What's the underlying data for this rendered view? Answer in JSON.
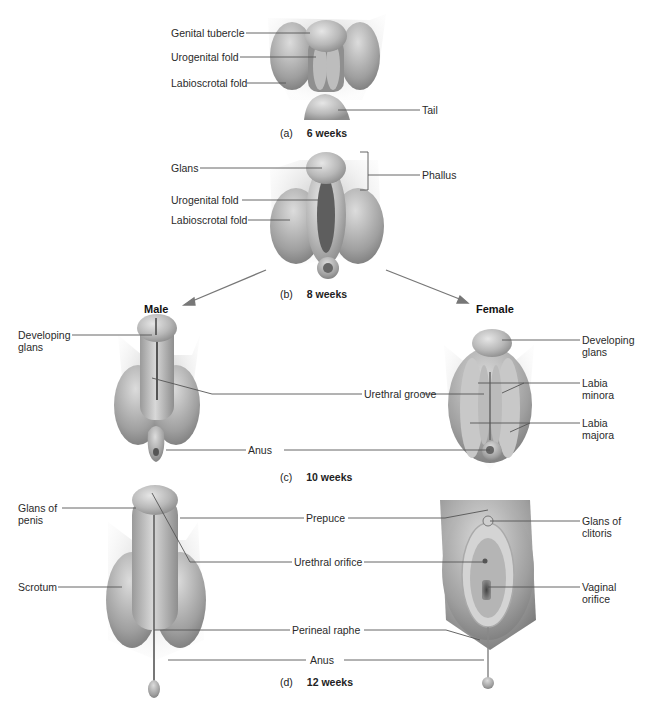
{
  "figure": {
    "panels": [
      {
        "id": "a",
        "tag": "(a)",
        "stage": "6 weeks",
        "labels": [
          "Genital tubercle",
          "Urogenital fold",
          "Labioscrotal fold",
          "Tail"
        ]
      },
      {
        "id": "b",
        "tag": "(b)",
        "stage": "8 weeks",
        "labels": [
          "Glans",
          "Urogenital fold",
          "Labioscrotal fold",
          "Phallus"
        ]
      },
      {
        "id": "c",
        "tag": "(c)",
        "stage": "10 weeks",
        "male_heading": "Male",
        "female_heading": "Female",
        "male_labels": [
          "Developing\nglans"
        ],
        "shared_labels": [
          "Urethral groove",
          "Anus"
        ],
        "female_labels": [
          "Developing\nglans",
          "Labia\nminora",
          "Labia\nmajora"
        ]
      },
      {
        "id": "d",
        "tag": "(d)",
        "stage": "12 weeks",
        "male_labels": [
          "Glans of\npenis",
          "Scrotum"
        ],
        "shared_labels": [
          "Prepuce",
          "Urethral orifice",
          "Perineal raphe",
          "Anus"
        ],
        "female_labels": [
          "Glans of\nclitoris",
          "Vaginal\norifice"
        ]
      }
    ]
  },
  "text": {
    "a_genital_tubercle": "Genital tubercle",
    "a_urogenital_fold": "Urogenital fold",
    "a_labioscrotal_fold": "Labioscrotal fold",
    "a_tail": "Tail",
    "a_tag": "(a)",
    "a_stage": "6 weeks",
    "b_glans": "Glans",
    "b_urogenital_fold": "Urogenital fold",
    "b_labioscrotal_fold": "Labioscrotal fold",
    "b_phallus": "Phallus",
    "b_tag": "(b)",
    "b_stage": "8 weeks",
    "male": "Male",
    "female": "Female",
    "c_male_dev_glans_1": "Developing",
    "c_male_dev_glans_2": "glans",
    "c_urethral_groove": "Urethral groove",
    "c_anus": "Anus",
    "c_fem_dev_glans_1": "Developing",
    "c_fem_dev_glans_2": "glans",
    "c_labia_minora_1": "Labia",
    "c_labia_minora_2": "minora",
    "c_labia_majora_1": "Labia",
    "c_labia_majora_2": "majora",
    "c_tag": "(c)",
    "c_stage": "10 weeks",
    "d_glans_penis_1": "Glans of",
    "d_glans_penis_2": "penis",
    "d_scrotum": "Scrotum",
    "d_prepuce": "Prepuce",
    "d_urethral_orifice": "Urethral orifice",
    "d_perineal_raphe": "Perineal raphe",
    "d_anus": "Anus",
    "d_glans_clitoris_1": "Glans of",
    "d_glans_clitoris_2": "clitoris",
    "d_vaginal_orifice_1": "Vaginal",
    "d_vaginal_orifice_2": "orifice",
    "d_tag": "(d)",
    "d_stage": "12 weeks"
  },
  "colors": {
    "tissue_light": "#d9d9d9",
    "tissue_mid": "#a9a9a9",
    "tissue_dark": "#6e6e6e",
    "leader_line": "#555555",
    "arrow": "#777777"
  }
}
